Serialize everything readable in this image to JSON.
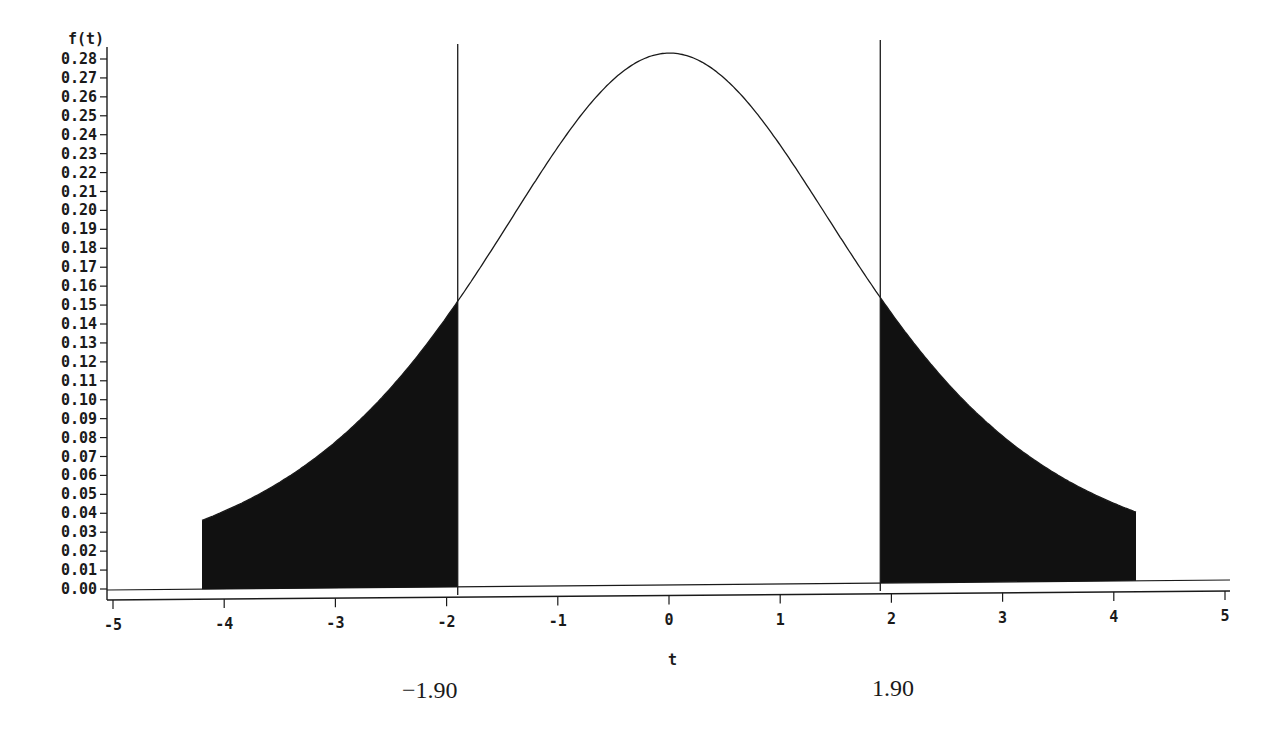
{
  "chart_data": {
    "type": "area",
    "title": "",
    "xlabel": "t",
    "ylabel": "f(t)",
    "xlim": [
      -5,
      5
    ],
    "ylim": [
      0,
      0.28
    ],
    "grid": false,
    "legend": null,
    "x_ticks": [
      "-5",
      "-4",
      "-3",
      "-2",
      "-1",
      "0",
      "1",
      "2",
      "3",
      "4",
      "5"
    ],
    "y_ticks": [
      "0.00",
      "0.01",
      "0.02",
      "0.03",
      "0.04",
      "0.05",
      "0.06",
      "0.07",
      "0.08",
      "0.09",
      "0.10",
      "0.11",
      "0.12",
      "0.13",
      "0.14",
      "0.15",
      "0.16",
      "0.17",
      "0.18",
      "0.19",
      "0.20",
      "0.21",
      "0.22",
      "0.23",
      "0.24",
      "0.25",
      "0.26",
      "0.27",
      "0.28"
    ],
    "curve": {
      "description": "Symmetric t-distribution density",
      "x": [
        -4.2,
        -4.0,
        -3.5,
        -3.0,
        -2.5,
        -2.0,
        -1.9,
        -1.5,
        -1.0,
        -0.5,
        0,
        0.5,
        1.0,
        1.5,
        1.9,
        2.0,
        2.5,
        3.0,
        3.5,
        4.0,
        4.2
      ],
      "y": [
        0.002,
        0.003,
        0.006,
        0.012,
        0.026,
        0.046,
        0.052,
        0.094,
        0.168,
        0.243,
        0.281,
        0.243,
        0.168,
        0.094,
        0.052,
        0.046,
        0.026,
        0.012,
        0.006,
        0.003,
        0.002
      ]
    },
    "critical_values": [
      -1.9,
      1.9
    ],
    "shaded_regions": [
      {
        "from": -4.2,
        "to": -1.9,
        "label": "left tail"
      },
      {
        "from": 1.9,
        "to": 4.2,
        "label": "right tail"
      }
    ],
    "annotations": [
      {
        "text": "−1.90",
        "x": -1.9
      },
      {
        "text": "1.90",
        "x": 1.9
      }
    ]
  },
  "colors": {
    "ink": "#1a1a1a",
    "background": "#ffffff",
    "fill": "#111111"
  }
}
